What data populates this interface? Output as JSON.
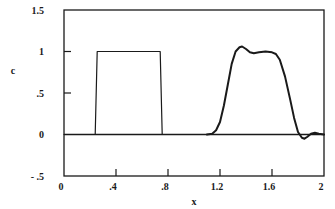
{
  "chart_data": {
    "type": "line",
    "title": "",
    "xlabel": "x",
    "ylabel": "c",
    "xlim": [
      0,
      2
    ],
    "ylim": [
      -0.5,
      1.5
    ],
    "grid": false,
    "legend": null,
    "x_ticks": [
      {
        "value": 0,
        "label": "0"
      },
      {
        "value": 0.4,
        "label": ".4"
      },
      {
        "value": 0.8,
        "label": ".8"
      },
      {
        "value": 1.2,
        "label": "1.2"
      },
      {
        "value": 1.6,
        "label": "1.6"
      },
      {
        "value": 2,
        "label": "2"
      }
    ],
    "y_ticks": [
      {
        "value": 1.5,
        "label": "1.5"
      },
      {
        "value": 1,
        "label": "1"
      },
      {
        "value": 0.5,
        "label": ".5"
      },
      {
        "value": 0,
        "label": "0"
      },
      {
        "value": -0.5,
        "label": "- .5"
      }
    ],
    "series": [
      {
        "name": "initial square pulse",
        "stroke_width": 1.2,
        "x": [
          0,
          0.24,
          0.255,
          0.74,
          0.755,
          2
        ],
        "y": [
          0,
          0,
          1,
          1,
          0,
          0
        ]
      },
      {
        "name": "transported profile",
        "stroke_width": 2,
        "x": [
          1.1,
          1.14,
          1.17,
          1.2,
          1.23,
          1.26,
          1.29,
          1.32,
          1.35,
          1.37,
          1.4,
          1.43,
          1.46,
          1.5,
          1.55,
          1.6,
          1.63,
          1.66,
          1.7,
          1.74,
          1.77,
          1.8,
          1.83,
          1.85,
          1.87,
          1.9,
          1.93,
          1.96,
          2.0
        ],
        "y": [
          0,
          0.01,
          0.05,
          0.15,
          0.35,
          0.6,
          0.85,
          1.0,
          1.05,
          1.06,
          1.03,
          0.99,
          0.98,
          0.99,
          1.0,
          0.99,
          0.97,
          0.9,
          0.7,
          0.42,
          0.2,
          0.03,
          -0.04,
          -0.05,
          -0.03,
          0.01,
          0.02,
          0.01,
          0.0
        ]
      }
    ]
  }
}
